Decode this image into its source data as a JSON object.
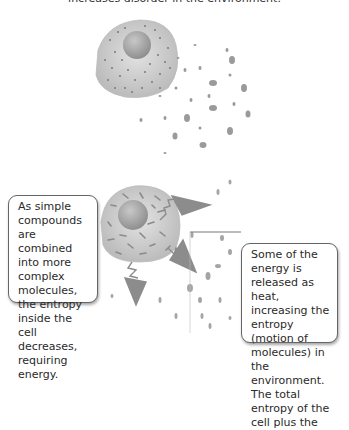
{
  "caption": "increases disorder in the environment.",
  "callouts": {
    "left": "As simple compounds are combined into more complex molecules, the entropy inside the cell decreases, requiring energy.",
    "right": "Some of the energy is released as heat, increasing the entropy (motion of molecules) in the environment. The total entropy of the cell plus the"
  },
  "colors": {
    "cell_fill": "#cfcfcf",
    "nucleus_fill": "#a9a9a9",
    "dots": "#777777",
    "arrows": "#888888",
    "callout_border": "#666666"
  }
}
